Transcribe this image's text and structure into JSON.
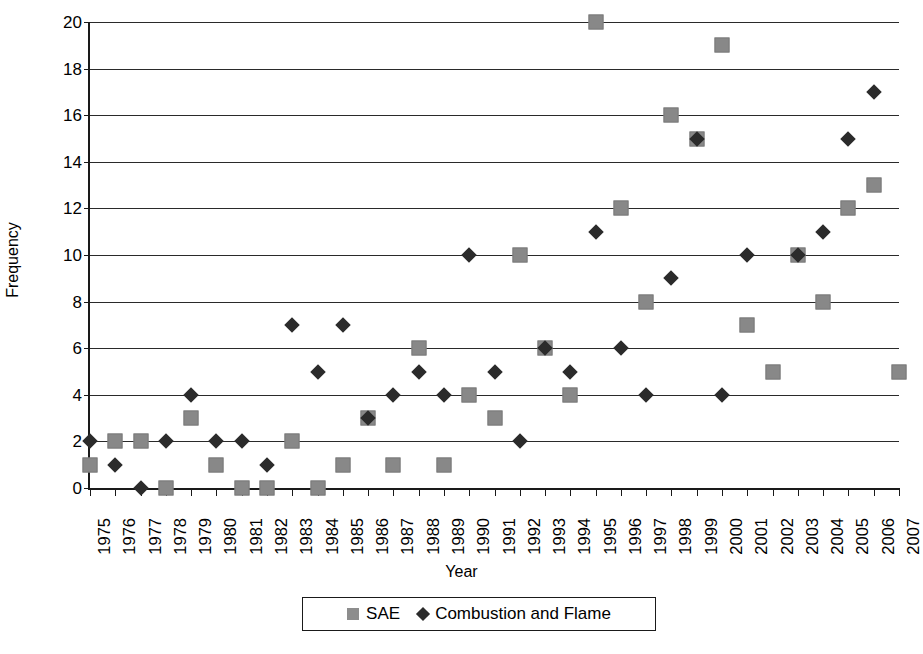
{
  "chart_data": {
    "type": "scatter",
    "title": "",
    "xlabel": "Year",
    "ylabel": "Frequency",
    "ylim": [
      0,
      20
    ],
    "ytick_step": 2,
    "yticks": [
      0,
      2,
      4,
      6,
      8,
      10,
      12,
      14,
      16,
      18,
      20
    ],
    "grid": true,
    "legend_position": "bottom-center",
    "categories": [
      "1975",
      "1976",
      "1977",
      "1978",
      "1979",
      "1980",
      "1981",
      "1982",
      "1983",
      "1984",
      "1985",
      "1986",
      "1987",
      "1988",
      "1989",
      "1990",
      "1991",
      "1992",
      "1993",
      "1994",
      "1995",
      "1996",
      "1997",
      "1998",
      "1999",
      "2000",
      "2001",
      "2002",
      "2003",
      "2004",
      "2005",
      "2006",
      "2007"
    ],
    "series": [
      {
        "name": "SAE",
        "marker": "square",
        "color": "#8d8d8d",
        "values": [
          1,
          2,
          2,
          0,
          3,
          1,
          0,
          0,
          2,
          0,
          1,
          3,
          1,
          6,
          1,
          4,
          3,
          10,
          6,
          4,
          20,
          12,
          8,
          16,
          15,
          19,
          7,
          5,
          10,
          8,
          12,
          13,
          5
        ]
      },
      {
        "name": "Combustion and Flame",
        "marker": "diamond",
        "color": "#2b2b2b",
        "values": [
          2,
          1,
          0,
          2,
          4,
          2,
          2,
          1,
          7,
          5,
          7,
          3,
          4,
          5,
          4,
          10,
          5,
          2,
          6,
          5,
          11,
          6,
          4,
          9,
          15,
          4,
          10,
          null,
          10,
          11,
          15,
          17,
          null
        ]
      }
    ]
  },
  "legend": {
    "entries": [
      {
        "label": "SAE",
        "marker": "square-marker-icon"
      },
      {
        "label": "Combustion and Flame",
        "marker": "diamond-marker-icon"
      }
    ]
  },
  "axes": {
    "y_title": "Frequency",
    "x_title": "Year"
  },
  "page_artifact": {
    "text": " "
  }
}
